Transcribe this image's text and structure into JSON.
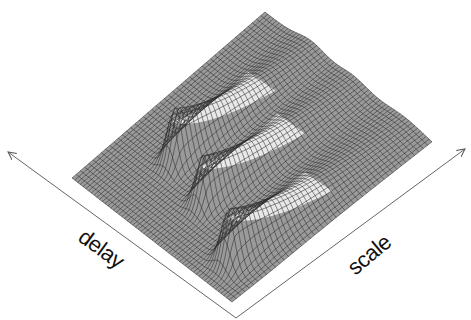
{
  "figure": {
    "type": "3d-wireframe-surface",
    "axes": {
      "delay": {
        "label": "delay"
      },
      "scale": {
        "label": "scale"
      }
    },
    "colors": {
      "background": "#ffffff",
      "mesh_line": "#2a2a2a",
      "mesh_fill": "#9a9a9a",
      "axis": "#555555",
      "label": "#111111"
    },
    "peaks_count": 3
  },
  "chart_data": {
    "type": "surface",
    "title": "",
    "xlabel": "delay",
    "ylabel": "scale",
    "zlabel": "",
    "grid": true,
    "legend": null,
    "surface_corners_px": {
      "left": [
        72,
        178
      ],
      "top": [
        265,
        12
      ],
      "right": [
        432,
        143
      ],
      "bottom": [
        232,
        302
      ]
    },
    "peaks": [
      {
        "name": "peak-1",
        "apex_px": [
          287,
          67
        ],
        "relative_height": 0.8
      },
      {
        "name": "peak-2",
        "apex_px": [
          237,
          128
        ],
        "relative_height": 0.85
      },
      {
        "name": "peak-3",
        "apex_px": [
          235,
          222
        ],
        "relative_height": 0.9
      }
    ]
  }
}
